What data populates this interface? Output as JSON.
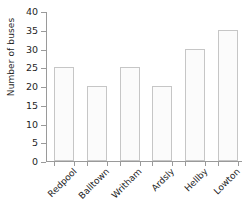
{
  "chart_data": {
    "type": "bar",
    "title": "",
    "subtitle": "",
    "xlabel": "",
    "ylabel": "Number of buses",
    "categories": [
      "Redpool",
      "Balltown",
      "Writham",
      "Ardsly",
      "Hellby",
      "Lowton"
    ],
    "values": [
      25,
      20,
      25,
      20,
      30,
      35
    ],
    "series": [
      {
        "name": "Number of buses",
        "values": [
          25,
          20,
          25,
          20,
          30,
          35
        ]
      }
    ],
    "ylim": [
      0,
      40
    ],
    "y_ticks": [
      0,
      5,
      10,
      15,
      20,
      25,
      30,
      35,
      40
    ],
    "y_tick_labels": [
      "0",
      "5",
      "10",
      "15",
      "20",
      "25",
      "30",
      "35",
      "40"
    ],
    "grid": false,
    "legend": false,
    "legend_position": "none",
    "bar_fill_color": "#fbfbfb",
    "bar_border_color": "#c6c6c6",
    "axis_color": "#9a9a9a",
    "text_color": "#1f1f1f",
    "background_color": "#ffffff",
    "x_label_rotation_degrees": -45
  }
}
